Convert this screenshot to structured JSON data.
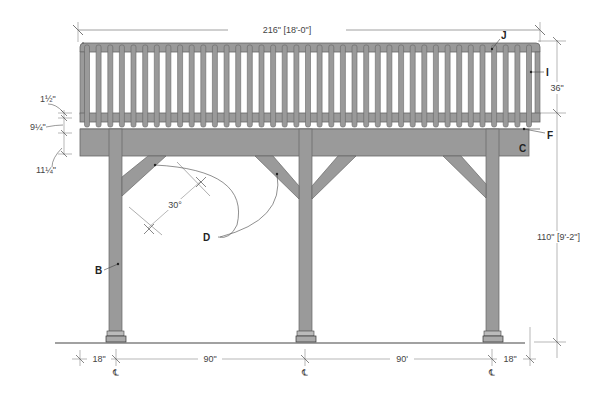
{
  "colors": {
    "wood": "#9a9a9a",
    "wood_dark": "#7a7a7a",
    "outline": "#666666",
    "dim_line": "#555555",
    "ground": "#444444"
  },
  "dimensions": {
    "overall_width": "216\" [18'-0\"]",
    "railing_height": "36\"",
    "post_height": "110\" [9'-2\"]",
    "rail_1": "1½\"",
    "rail_2": "9¼\"",
    "rail_3": "11¼\"",
    "brace_angle": "30°",
    "left_overhang": "18\"",
    "span_1": "90\"",
    "span_2": "90'",
    "right_overhang": "18\""
  },
  "centerline_symbol": "℄",
  "labels": {
    "B": "B",
    "C": "C",
    "D": "D",
    "F": "F",
    "I": "I",
    "J": "J"
  },
  "structure": {
    "baluster_count": 39,
    "post_count": 3,
    "brace_count": 4
  }
}
